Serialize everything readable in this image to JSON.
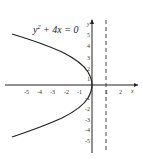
{
  "equation": {
    "lhs": "y",
    "exp": "2",
    "rest": " + 4x = 0"
  },
  "axes": {
    "x_label": "x",
    "y_label": "y"
  },
  "x_ticks": [
    "-5",
    "-4",
    "-3",
    "-2",
    "-1",
    "1",
    "2"
  ],
  "y_ticks": [
    "5",
    "4",
    "3",
    "2",
    "1",
    "-1",
    "-2",
    "-3",
    "-4",
    "-5"
  ],
  "directrix": "x = 1"
}
